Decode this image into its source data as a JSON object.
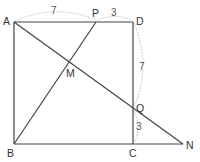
{
  "figure": {
    "type": "geometry",
    "colors": {
      "line": "#444444",
      "dashed": "#b5b5b5",
      "text": "#333333"
    },
    "points": {
      "A": {
        "label": "A",
        "x": 14,
        "y": 22
      },
      "P": {
        "label": "P",
        "x": 96,
        "y": 22
      },
      "D": {
        "label": "D",
        "x": 133,
        "y": 22
      },
      "M": {
        "label": "M",
        "x": 69,
        "y": 62
      },
      "Q": {
        "label": "Q",
        "x": 133,
        "y": 109
      },
      "B": {
        "label": "B",
        "x": 14,
        "y": 144
      },
      "C": {
        "label": "C",
        "x": 133,
        "y": 144
      },
      "N": {
        "label": "N",
        "x": 183,
        "y": 144
      }
    },
    "segments": [
      [
        "A",
        "D"
      ],
      [
        "D",
        "C"
      ],
      [
        "C",
        "N"
      ],
      [
        "B",
        "C"
      ],
      [
        "A",
        "B"
      ],
      [
        "B",
        "P"
      ],
      [
        "A",
        "N"
      ]
    ],
    "measurements": {
      "AP": "7",
      "PD": "3",
      "DQ": "7",
      "QC": "3"
    }
  }
}
